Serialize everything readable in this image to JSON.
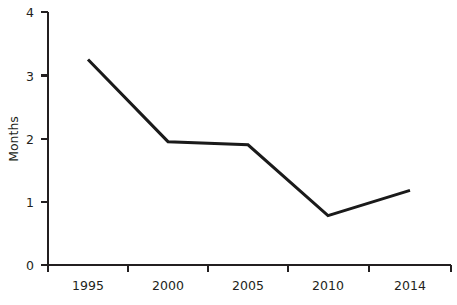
{
  "chart_data": {
    "type": "line",
    "title": "",
    "subtitle": "",
    "xlabel": "",
    "ylabel": "Months",
    "categories": [
      "1995",
      "2000",
      "2005",
      "2010",
      "2014"
    ],
    "x": [
      1995,
      2000,
      2005,
      2010,
      2014
    ],
    "values": [
      3.25,
      1.95,
      1.9,
      0.78,
      1.18
    ],
    "series": [
      {
        "name": "Months",
        "values": [
          3.25,
          1.95,
          1.9,
          0.78,
          1.18
        ],
        "color": "#1a1a1a"
      }
    ],
    "ylim": [
      0,
      4
    ],
    "y_ticks": [
      0,
      1,
      2,
      3,
      4
    ],
    "y_tick_labels": [
      "0",
      "1",
      "2",
      "3",
      "4"
    ],
    "x_tick_labels": [
      "1995",
      "2000",
      "2005",
      "2010",
      "2014"
    ],
    "grid": false,
    "legend": false,
    "legend_position": "none",
    "line_color": "#1a1a1a",
    "axis_color": "#231f20",
    "background_color": "#ffffff",
    "markers": false,
    "annotations": []
  },
  "axes": {
    "y_title": "Months",
    "x_title": ""
  }
}
